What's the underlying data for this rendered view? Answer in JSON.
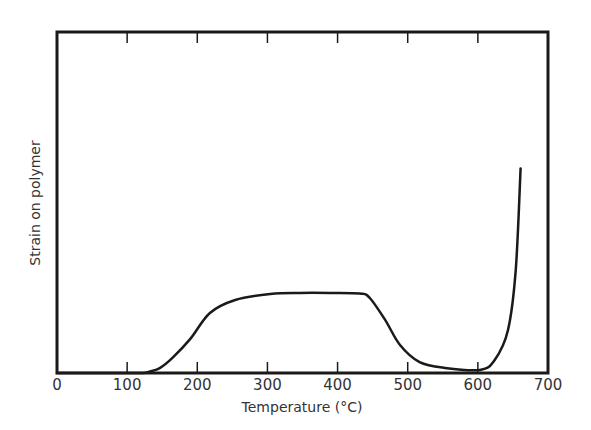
{
  "chart_data": {
    "type": "line",
    "title": "",
    "xlabel": "Temperature (°C)",
    "ylabel": "Strain on polymer",
    "xlim": [
      0,
      700
    ],
    "ylim": [
      0,
      100
    ],
    "x_ticks": [
      0,
      100,
      200,
      300,
      400,
      500,
      600,
      700
    ],
    "x_tick_labels": [
      "0",
      "100",
      "200",
      "300",
      "400",
      "500",
      "600",
      "700"
    ],
    "y_ticks": [],
    "grid": false,
    "legend": null,
    "frame": "box with ticks on top and bottom",
    "series": [
      {
        "name": "Strain",
        "x": [
          0,
          111,
          130,
          147,
          165,
          190,
          218,
          254,
          304,
          346,
          390,
          432,
          446,
          468,
          489,
          517,
          553,
          603,
          624,
          643,
          654,
          661
        ],
        "y": [
          0,
          0,
          0.3,
          1.5,
          4.5,
          10,
          17.6,
          21.4,
          23.2,
          23.5,
          23.5,
          23.3,
          22,
          15.5,
          8.2,
          3.2,
          1.5,
          0.9,
          3.8,
          12.6,
          30,
          60
        ]
      }
    ]
  }
}
